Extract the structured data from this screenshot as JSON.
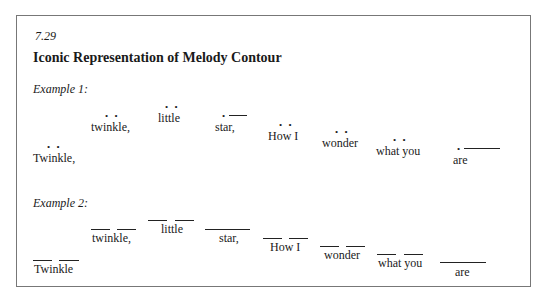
{
  "figure": {
    "number": "7.29",
    "title": "Iconic Representation of Melody Contour",
    "example1": {
      "label": "Example 1:",
      "words": [
        "Twinkle,",
        "twinkle,",
        "little",
        "star,",
        "How I",
        "wonder",
        "what you",
        "are"
      ],
      "notation": [
        "dot-dot",
        "dot-dot",
        "dot-dot",
        "dot-line",
        "dot-dot",
        "dot-dot",
        "dot-dot",
        "dot-line"
      ]
    },
    "example2": {
      "label": "Example 2:",
      "words": [
        "Twinkle",
        "twinkle,",
        "little",
        "star,",
        "How I",
        "wonder",
        "what you",
        "are"
      ],
      "notation": [
        "two-bars",
        "two-bars",
        "two-bars",
        "long-bar",
        "two-bars",
        "two-bars",
        "two-bars",
        "long-bar"
      ]
    },
    "dot_glyph": "• •",
    "single_dot_glyph": "•"
  }
}
